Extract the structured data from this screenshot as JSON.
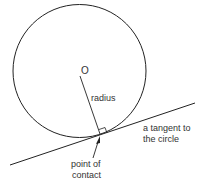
{
  "diagram": {
    "labels": {
      "center": "O",
      "radius": "radius",
      "tangent_line1": "a tangent to",
      "tangent_line2": "the circle",
      "contact_line1": "point of",
      "contact_line2": "contact"
    },
    "colors": {
      "stroke": "#222222",
      "text": "#333333",
      "background": "#ffffff"
    }
  }
}
